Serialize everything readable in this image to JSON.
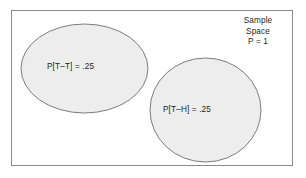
{
  "figure": {
    "frame": {
      "name": "sample-space-rectangle",
      "x": 11,
      "y": 10,
      "width": 282,
      "height": 156,
      "stroke": "#8a8a8a",
      "fill": "#ffffff"
    },
    "shapes": [
      {
        "name": "event-tt-ellipse",
        "shape": "ellipse",
        "cx": 84.5,
        "cy": 68.5,
        "rx": 63.5,
        "ry": 44.5,
        "fill": "#ededed",
        "stroke": "#6e6e6e"
      },
      {
        "name": "event-th-circle",
        "shape": "ellipse",
        "cx": 205.5,
        "cy": 110,
        "rx": 55.5,
        "ry": 52,
        "fill": "#ededed",
        "stroke": "#6e6e6e"
      }
    ],
    "labels": {
      "event_tt": "P[T–T] = .25",
      "event_th": "P[T–H] = .25",
      "sample_space_line1": "Sample",
      "sample_space_line2": "Space",
      "sample_space_line3": "P = 1"
    },
    "colors": {
      "shape_fill": "#ededed",
      "shape_stroke": "#6e6e6e",
      "frame_stroke": "#8a8a8a",
      "text": "#231f20",
      "background": "#ffffff"
    }
  }
}
